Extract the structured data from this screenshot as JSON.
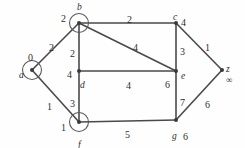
{
  "figure": {
    "kind": "weighted-undirected-graph",
    "width": 245,
    "height": 148,
    "ink_color": "#4a4a4a",
    "node_color": "#3a3a3a",
    "background": "#ffffff"
  },
  "graph_data": {
    "type": "graph",
    "directed": false,
    "nodes": [
      {
        "id": "a",
        "name": "a",
        "label": "0",
        "x": 32,
        "y": 70,
        "circled": true,
        "name_dx": -13,
        "name_dy": 1,
        "label_dx": -4,
        "label_dy": -17
      },
      {
        "id": "b",
        "name": "b",
        "label": "2",
        "x": 79,
        "y": 23,
        "circled": true,
        "name_dx": -2,
        "name_dy": -20,
        "label_dx": -18,
        "label_dy": -9
      },
      {
        "id": "c",
        "name": "c",
        "label": "4",
        "x": 176,
        "y": 23,
        "circled": false,
        "name_dx": -3,
        "name_dy": -10,
        "label_dx": 5,
        "label_dy": -5
      },
      {
        "id": "d",
        "name": "d",
        "label": "4",
        "x": 79,
        "y": 71,
        "circled": false,
        "name_dx": 1,
        "name_dy": 10,
        "label_dx": -12,
        "label_dy": -1
      },
      {
        "id": "e",
        "name": "e",
        "label": "6",
        "x": 176,
        "y": 71,
        "circled": false,
        "name_dx": 5,
        "name_dy": 1,
        "label_dx": -11,
        "label_dy": 9
      },
      {
        "id": "f",
        "name": "f",
        "label": "1",
        "x": 79,
        "y": 122,
        "circled": true,
        "name_dx": -1,
        "name_dy": 19,
        "label_dx": -18,
        "label_dy": 1
      },
      {
        "id": "g",
        "name": "g",
        "label": "6",
        "x": 176,
        "y": 120,
        "circled": false,
        "name_dx": -4,
        "name_dy": 12,
        "label_dx": 7,
        "label_dy": 12
      },
      {
        "id": "z",
        "name": "z",
        "label": "∞",
        "x": 222,
        "y": 70,
        "circled": false,
        "name_dx": 4,
        "name_dy": -5,
        "label_dx": 4,
        "label_dy": 6
      }
    ],
    "edges": [
      {
        "source": "a",
        "target": "b",
        "weight": "2",
        "wx": 49,
        "wy": 43
      },
      {
        "source": "a",
        "target": "f",
        "weight": "1",
        "wx": 47,
        "wy": 102
      },
      {
        "source": "b",
        "target": "c",
        "weight": "2",
        "wx": 127,
        "wy": 15
      },
      {
        "source": "b",
        "target": "d",
        "weight": "2",
        "wx": 70,
        "wy": 49
      },
      {
        "source": "b",
        "target": "e",
        "weight": "4",
        "wx": 133,
        "wy": 43
      },
      {
        "source": "c",
        "target": "e",
        "weight": "3",
        "wx": 180,
        "wy": 47
      },
      {
        "source": "c",
        "target": "z",
        "weight": "1",
        "wx": 205,
        "wy": 43
      },
      {
        "source": "d",
        "target": "e",
        "weight": "4",
        "wx": 126,
        "wy": 81
      },
      {
        "source": "d",
        "target": "f",
        "weight": "3",
        "wx": 70,
        "wy": 99
      },
      {
        "source": "e",
        "target": "g",
        "weight": "7",
        "wx": 180,
        "wy": 98
      },
      {
        "source": "f",
        "target": "g",
        "weight": "5",
        "wx": 125,
        "wy": 130
      },
      {
        "source": "g",
        "target": "z",
        "weight": "6",
        "wx": 205,
        "wy": 100
      }
    ],
    "node_radius": 2.0,
    "ring_radius": 9.5
  }
}
